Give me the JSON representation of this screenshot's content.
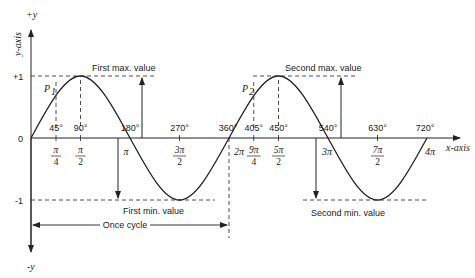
{
  "diagram": {
    "type": "sine-wave",
    "axes": {
      "y_positive_label": "+y",
      "y_negative_label": "-y",
      "y_axis_label": "y-axis",
      "x_axis_label": "x-axis",
      "origin_label": "0",
      "plus_one_label": "+1",
      "minus_one_label": "-1"
    },
    "degree_ticks": [
      "45°",
      "90°",
      "180°",
      "270°",
      "360°",
      "405°",
      "450°",
      "540°",
      "630°",
      "720°"
    ],
    "radian_ticks": {
      "pi_4": {
        "num": "π",
        "den": "4"
      },
      "pi_2": {
        "num": "π",
        "den": "2"
      },
      "pi": "π",
      "three_pi_2": {
        "num": "3π",
        "den": "2"
      },
      "two_pi": "2π",
      "nine_pi_4": {
        "num": "9π",
        "den": "4"
      },
      "five_pi_2": {
        "num": "5π",
        "den": "2"
      },
      "three_pi": "3π",
      "seven_pi_2": {
        "num": "7π",
        "den": "2"
      },
      "four_pi": "4π"
    },
    "points": {
      "p1": {
        "label": "P",
        "sub": "1"
      },
      "p2": {
        "label": "P",
        "sub": "2"
      }
    },
    "annotations": {
      "first_max": "First max. value",
      "second_max": "Second max. value",
      "first_min": "First min. value",
      "second_min": "Second min. value",
      "cycle": "Once cycle"
    },
    "colors": {
      "line": "#222222",
      "background": "#ffffff"
    }
  }
}
